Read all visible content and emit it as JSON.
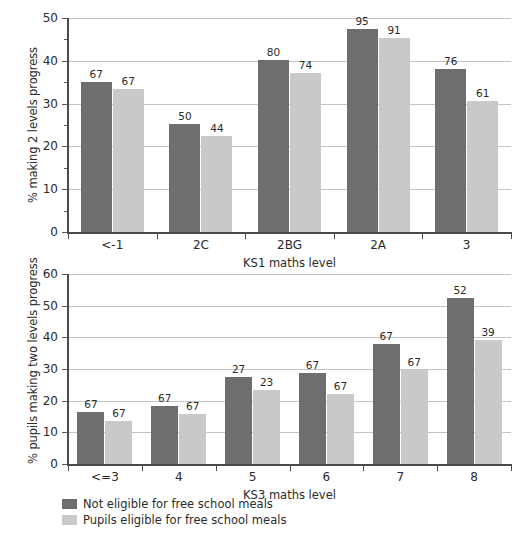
{
  "chart_data": [
    {
      "id": "ks1-chart",
      "type": "bar",
      "title": "",
      "xlabel": "KS1 maths level",
      "ylabel": "% making 2 levels progress",
      "categories": [
        "<-1",
        "2C",
        "2BG",
        "2A",
        "3"
      ],
      "ylim": [
        0,
        50
      ],
      "yticks": [
        0,
        10,
        20,
        30,
        40,
        50
      ],
      "ytick_labels": [
        "0",
        "10",
        "20",
        "30",
        "40",
        "50"
      ],
      "yminor_step": 5,
      "grid": true,
      "legend_position": "below-figure",
      "series": [
        {
          "name": "Not eligible for free school meals",
          "color": "#6e6e6e",
          "values": [
            35.0,
            25.2,
            40.2,
            47.4,
            38.1
          ],
          "point_labels": [
            "67",
            "50",
            "80",
            "95",
            "76"
          ]
        },
        {
          "name": "Pupils eligible for free school meals",
          "color": "#c9c9c9",
          "values": [
            33.5,
            22.4,
            37.1,
            45.4,
            30.6
          ],
          "point_labels": [
            "67",
            "44",
            "74",
            "91",
            "61"
          ]
        }
      ]
    },
    {
      "id": "ks3-chart",
      "type": "bar",
      "title": "",
      "xlabel": "KS3 maths level",
      "ylabel": "% pupils making two levels progress",
      "categories": [
        "<=3",
        "4",
        "5",
        "6",
        "7",
        "8"
      ],
      "ylim": [
        0,
        60
      ],
      "yticks": [
        0,
        10,
        20,
        30,
        40,
        50,
        60
      ],
      "ytick_labels": [
        "0",
        "10",
        "20",
        "30",
        "40",
        "50",
        "60"
      ],
      "yminor_step": 10,
      "grid": true,
      "legend_position": "below-figure",
      "series": [
        {
          "name": "Not eligible for free school meals",
          "color": "#6e6e6e",
          "values": [
            16.4,
            18.4,
            27.4,
            28.6,
            38.0,
            52.5
          ],
          "point_labels": [
            "67",
            "67",
            "27",
            "67",
            "67",
            "52"
          ]
        },
        {
          "name": "Pupils eligible for free school meals",
          "color": "#c9c9c9",
          "values": [
            13.6,
            15.7,
            23.5,
            22.2,
            29.8,
            39.1
          ],
          "point_labels": [
            "67",
            "67",
            "23",
            "67",
            "67",
            "39"
          ]
        }
      ]
    }
  ],
  "legend": {
    "items": [
      {
        "label": "Not eligible for free school meals",
        "color": "#6e6e6e"
      },
      {
        "label": "Pupils eligible for free school meals",
        "color": "#c9c9c9"
      }
    ]
  }
}
